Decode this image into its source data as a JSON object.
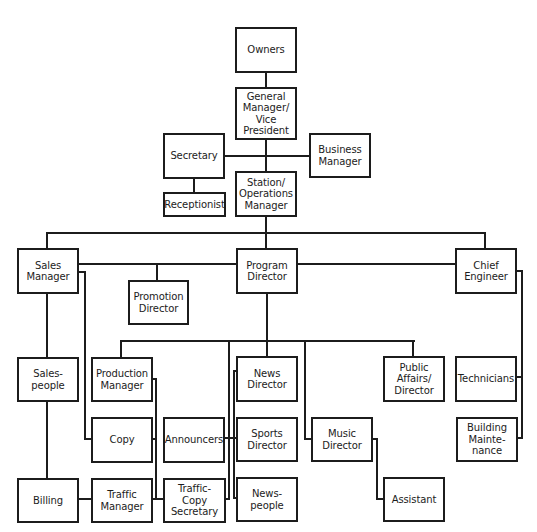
{
  "diagram": {
    "type": "organizational-chart",
    "colors": {
      "line": "#1c1c1c",
      "box_fill": "#ffffff"
    },
    "nodes": {
      "owners": "Owners",
      "general_manager": "General\nManager/\nVice\nPresident",
      "secretary": "Secretary",
      "business_manager": "Business\nManager",
      "receptionist": "Receptionist",
      "station_operations_manager": "Station/\nOperations\nManager",
      "sales_manager": "Sales\nManager",
      "program_director": "Program\nDirector",
      "chief_engineer": "Chief\nEngineer",
      "promotion_director": "Promotion\nDirector",
      "salespeople": "Sales-\npeople",
      "production_manager": "Production\nManager",
      "news_director": "News\nDirector",
      "public_affairs_director": "Public\nAffairs/\nDirector",
      "technicians": "Technicians",
      "copy": "Copy",
      "announcers": "Announcers",
      "sports_director": "Sports\nDirector",
      "music_director": "Music\nDirector",
      "building_maintenance": "Building\nMainte-\nnance",
      "billing": "Billing",
      "traffic_manager": "Traffic\nManager",
      "traffic_copy_secretary": "Traffic-Copy\nSecretary",
      "newspeople": "News-\npeople",
      "assistant": "Assistant"
    },
    "edges": [
      [
        "owners",
        "general_manager"
      ],
      [
        "general_manager",
        "secretary"
      ],
      [
        "general_manager",
        "business_manager"
      ],
      [
        "general_manager",
        "station_operations_manager"
      ],
      [
        "secretary",
        "receptionist"
      ],
      [
        "station_operations_manager",
        "sales_manager"
      ],
      [
        "station_operations_manager",
        "program_director"
      ],
      [
        "station_operations_manager",
        "chief_engineer"
      ],
      [
        "program_director",
        "promotion_director"
      ],
      [
        "sales_manager",
        "salespeople"
      ],
      [
        "salespeople",
        "billing"
      ],
      [
        "sales_manager",
        "copy"
      ],
      [
        "program_director",
        "production_manager"
      ],
      [
        "program_director",
        "news_director"
      ],
      [
        "program_director",
        "announcers"
      ],
      [
        "program_director",
        "traffic_copy_secretary"
      ],
      [
        "program_director",
        "music_director"
      ],
      [
        "program_director",
        "public_affairs_director"
      ],
      [
        "production_manager",
        "copy"
      ],
      [
        "production_manager",
        "traffic_manager"
      ],
      [
        "billing",
        "traffic_manager"
      ],
      [
        "news_director",
        "sports_director"
      ],
      [
        "news_director",
        "newspeople"
      ],
      [
        "music_director",
        "assistant"
      ],
      [
        "chief_engineer",
        "technicians"
      ],
      [
        "chief_engineer",
        "building_maintenance"
      ]
    ]
  }
}
